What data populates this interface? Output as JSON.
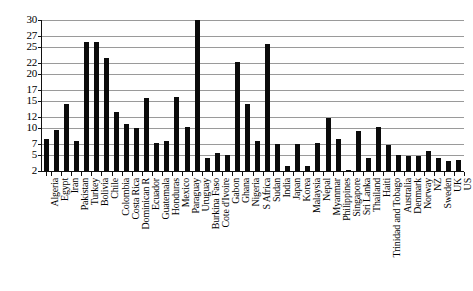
{
  "chart_data": {
    "type": "bar",
    "title": "",
    "subtitle": "",
    "xlabel": "",
    "ylabel": "",
    "ylim": [
      2,
      30
    ],
    "grid": true,
    "legend": "none",
    "bar_color": "#0b0b0b",
    "gridline_color": "#9a9a9a",
    "axis_color": "#111111",
    "y_ticks": [
      2,
      5,
      7,
      10,
      12,
      15,
      17,
      20,
      22,
      25,
      27,
      30
    ],
    "categories": [
      "Algeria",
      "Egypt",
      "Iran",
      "Pakistan",
      "Turkey",
      "Bolivia",
      "Chile",
      "Colombia",
      "Costa Rica",
      "Dominican R",
      "Ecuador",
      "Guatemala",
      "Honduras",
      "Mexico",
      "Paraguay",
      "Uruguay",
      "Burkina Faso",
      "Cote d'Ivoire",
      "Gabon",
      "Ghana",
      "Nigeria",
      "S Africa",
      "Sudan",
      "India",
      "Japan",
      "Korea",
      "Malaysia",
      "Nepal",
      "Myanmar",
      "Philippines",
      "Singapore",
      "Sri Lanka",
      "Thailand",
      "Haiti",
      "Trinidad and Tobago",
      "Australia",
      "Denmark",
      "Norway",
      "NZ",
      "Sweden",
      "UK",
      "US"
    ],
    "values": [
      8.0,
      9.6,
      14.5,
      7.6,
      26.0,
      26.0,
      23.0,
      13.0,
      10.7,
      10.0,
      15.6,
      7.2,
      7.6,
      15.8,
      10.2,
      30.0,
      4.4,
      5.4,
      5.0,
      22.2,
      14.5,
      7.5,
      25.5,
      7.1,
      3.0,
      7.1,
      3.0,
      7.2,
      11.9,
      8.0,
      2.2,
      9.4,
      4.4,
      10.2,
      6.9,
      5.0,
      4.8,
      4.8,
      5.8,
      4.5,
      3.8,
      4.0
    ]
  }
}
